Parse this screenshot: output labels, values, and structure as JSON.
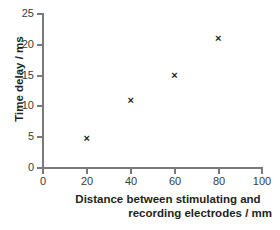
{
  "chart_data": {
    "type": "scatter",
    "title": "",
    "xlabel": "Distance between stimulating and recording electrodes / mm",
    "xlabel_lines": [
      "Distance between stimulating and",
      "recording electrodes / mm"
    ],
    "ylabel": "Time delay / ms",
    "xlim": [
      0,
      100
    ],
    "ylim": [
      0,
      25
    ],
    "xticks": [
      "0",
      "20",
      "40",
      "60",
      "80",
      "100"
    ],
    "yticks": [
      "0",
      "5",
      "10",
      "15",
      "20",
      "25"
    ],
    "grid": false,
    "legend": "none",
    "marker": "x",
    "marker_color": "#231f20",
    "axis_color": "#7a7a7a",
    "x": [
      20,
      40,
      60,
      80
    ],
    "y": [
      4.8,
      11,
      15,
      21
    ],
    "points": [
      {
        "x": 20,
        "y": 4.8
      },
      {
        "x": 40,
        "y": 11
      },
      {
        "x": 60,
        "y": 15
      },
      {
        "x": 80,
        "y": 21
      }
    ],
    "marker_glyph": "×"
  }
}
